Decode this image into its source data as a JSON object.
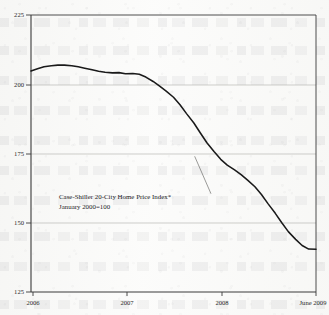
{
  "chart_data": {
    "type": "line",
    "title": "",
    "subtitle": "",
    "xlabel": "",
    "ylabel": "",
    "ylim": [
      125,
      225
    ],
    "yticks": [
      "125",
      "150",
      "175",
      "200",
      "225"
    ],
    "ytick_values": [
      125,
      150,
      175,
      200,
      225
    ],
    "xticks": [
      "2006",
      "2007",
      "2008",
      "June 2009"
    ],
    "xtick_values": [
      2006,
      2007,
      2008,
      2009.42
    ],
    "xlim": [
      2005.92,
      2009.42
    ],
    "grid": "horizontal",
    "legend": "none",
    "series": [
      {
        "name": "Case-Shiller 20-City Home Price Index",
        "color": "#1a1a1a",
        "x": [
          2005.92,
          2006.0,
          2006.08,
          2006.17,
          2006.25,
          2006.33,
          2006.42,
          2006.5,
          2006.58,
          2006.67,
          2006.75,
          2006.83,
          2006.92,
          2007.0,
          2007.08,
          2007.17,
          2007.25,
          2007.33,
          2007.42,
          2007.5,
          2007.58,
          2007.67,
          2007.75,
          2007.83,
          2007.92,
          2008.0,
          2008.08,
          2008.17,
          2008.25,
          2008.33,
          2008.42,
          2008.5,
          2008.58,
          2008.67,
          2008.75,
          2008.83,
          2008.92,
          2009.0,
          2009.08,
          2009.17,
          2009.25,
          2009.33,
          2009.42
        ],
        "values": [
          204.8,
          205.6,
          206.3,
          206.7,
          206.9,
          206.9,
          206.7,
          206.3,
          205.8,
          205.2,
          204.7,
          204.3,
          204.1,
          204.2,
          203.8,
          203.9,
          203.6,
          202.6,
          201.0,
          199.3,
          197.5,
          195.3,
          192.6,
          189.4,
          186.0,
          182.4,
          178.9,
          175.6,
          172.9,
          170.8,
          169.1,
          167.4,
          165.4,
          163.0,
          160.2,
          156.9,
          153.4,
          150.0,
          146.8,
          144.0,
          141.8,
          140.5,
          140.4
        ]
      }
    ],
    "annotations": [
      {
        "name": "series-callout",
        "line1": "Case-Shiller 20-City Home Price Index*",
        "line2": "January 2000=100",
        "leader_from": {
          "x": 2008.13,
          "y": 160.5
        },
        "leader_to": {
          "x": 2007.93,
          "y": 174.0
        }
      }
    ]
  },
  "axis": {
    "y_labels": [
      "225",
      "200",
      "175",
      "150",
      "125"
    ],
    "x_labels": [
      "2006",
      "2007",
      "2008",
      "June 2009"
    ]
  },
  "callout": {
    "line1": "Case-Shiller 20-City Home Price Index*",
    "line2": "January 2000=100"
  },
  "colors": {
    "line": "#1a1a1a",
    "axis": "#3a3a3a",
    "grid": "#b9b9b4",
    "text": "#23231f",
    "background": "#fbfbfa"
  }
}
